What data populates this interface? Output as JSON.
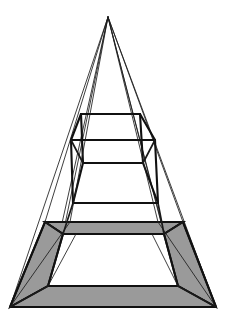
{
  "figure": {
    "kind": "line-drawing",
    "canvas": {
      "width": 229,
      "height": 324,
      "background": "#ffffff"
    },
    "colors": {
      "background": "#ffffff",
      "line": "#111111",
      "thin_line": "#1c1c1c",
      "shade_fill": "#9a9a9a",
      "shade_fill_dark": "#8f8f8f"
    },
    "stroke_widths": {
      "thin": 0.85,
      "medium": 1.7,
      "thick": 2.1
    },
    "geometry": {
      "apex": {
        "x": 108,
        "y": 17
      },
      "base_corners": {
        "front_left": {
          "x": 10,
          "y": 307
        },
        "front_right": {
          "x": 216,
          "y": 307
        },
        "back_left": {
          "x": 34,
          "y": 290
        },
        "back_right": {
          "x": 196,
          "y": 290
        }
      },
      "base_frame": {
        "outer_front_left": {
          "x": 10,
          "y": 307
        },
        "outer_front_right": {
          "x": 216,
          "y": 307
        },
        "outer_back_left": {
          "x": 45,
          "y": 222
        },
        "outer_back_right": {
          "x": 183,
          "y": 222
        },
        "inner_front_left": {
          "x": 48,
          "y": 286
        },
        "inner_front_right": {
          "x": 178,
          "y": 286
        },
        "inner_back_left": {
          "x": 63,
          "y": 234
        },
        "inner_back_right": {
          "x": 164,
          "y": 234
        }
      },
      "mid_box": {
        "top_back_left": {
          "x": 81,
          "y": 114
        },
        "top_back_right": {
          "x": 140,
          "y": 114
        },
        "top_front_left": {
          "x": 71,
          "y": 140
        },
        "top_front_right": {
          "x": 155,
          "y": 140
        },
        "bottom_back_left": {
          "x": 83,
          "y": 163
        },
        "bottom_back_right": {
          "x": 143,
          "y": 163
        },
        "bottom_front_left": {
          "x": 73,
          "y": 203
        },
        "bottom_front_right": {
          "x": 158,
          "y": 203
        }
      },
      "levels": [
        {
          "name": "apex",
          "y": 17
        },
        {
          "name": "upper-frame-back",
          "y": 114
        },
        {
          "name": "upper-frame-front",
          "y": 140
        },
        {
          "name": "lower-frame-back",
          "y": 163
        },
        {
          "name": "lower-frame-front",
          "y": 203
        },
        {
          "name": "base-frame-back",
          "y": 222
        },
        {
          "name": "base-frame-inner-back",
          "y": 234
        },
        {
          "name": "base-frame-inner-front",
          "y": 286
        },
        {
          "name": "base-frame-front",
          "y": 307
        }
      ]
    }
  }
}
